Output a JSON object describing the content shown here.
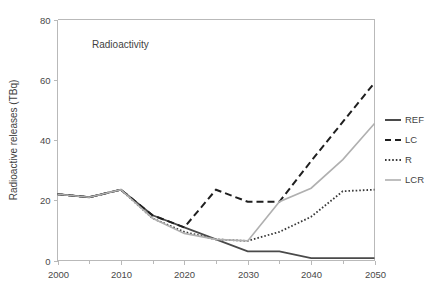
{
  "chart_data": {
    "type": "line",
    "title": "",
    "annotation": "Radioactivity",
    "xlabel": "",
    "ylabel": "Radioactive releases (TBq)",
    "xlim": [
      2000,
      2050
    ],
    "ylim": [
      0,
      80
    ],
    "grid": false,
    "legend_position": "right",
    "x_ticks": [
      "2000",
      "2010",
      "2020",
      "2030",
      "2040",
      "2050"
    ],
    "x_tick_values": [
      2000,
      2010,
      2020,
      2030,
      2040,
      2050
    ],
    "x_minor_tick_values": [
      2005,
      2015,
      2025,
      2035,
      2045
    ],
    "y_ticks": [
      "0",
      "20",
      "40",
      "60",
      "80"
    ],
    "y_tick_values": [
      0,
      20,
      40,
      60,
      80
    ],
    "x": [
      2000,
      2005,
      2010,
      2015,
      2020,
      2025,
      2030,
      2035,
      2040,
      2045,
      2050
    ],
    "series": [
      {
        "name": "REF",
        "style": "solid",
        "color": "#4a4a4a",
        "values": [
          22.0,
          21.0,
          23.5,
          15.0,
          11.0,
          7.0,
          3.0,
          3.0,
          0.8,
          0.8,
          0.8
        ]
      },
      {
        "name": "LC",
        "style": "dashed",
        "color": "#1f1f1f",
        "values": [
          22.0,
          21.0,
          23.5,
          15.0,
          11.0,
          23.5,
          19.5,
          19.5,
          33.0,
          46.0,
          59.0
        ]
      },
      {
        "name": "R",
        "style": "dotted",
        "color": "#3a3a3a",
        "values": [
          22.0,
          21.0,
          23.5,
          14.0,
          9.5,
          7.0,
          6.5,
          9.5,
          14.5,
          23.0,
          23.5
        ]
      },
      {
        "name": "LCR",
        "style": "solid-light",
        "color": "#b0b0b0",
        "values": [
          22.0,
          21.0,
          23.5,
          14.0,
          9.0,
          7.0,
          6.5,
          19.5,
          24.0,
          33.5,
          45.5
        ]
      }
    ]
  },
  "legend": {
    "items": [
      {
        "label": "REF",
        "swatch": "solid-dark"
      },
      {
        "label": "LC",
        "swatch": "dashed-dark"
      },
      {
        "label": "R",
        "swatch": "dotted-dark"
      },
      {
        "label": "LCR",
        "swatch": "solid-light"
      }
    ]
  },
  "colors": {
    "ref": "#4a4a4a",
    "lc": "#1f1f1f",
    "r": "#3a3a3a",
    "lcr": "#b0b0b0",
    "axis": "#b9b9b9",
    "text": "#3f3f3f",
    "background": "#ffffff"
  }
}
